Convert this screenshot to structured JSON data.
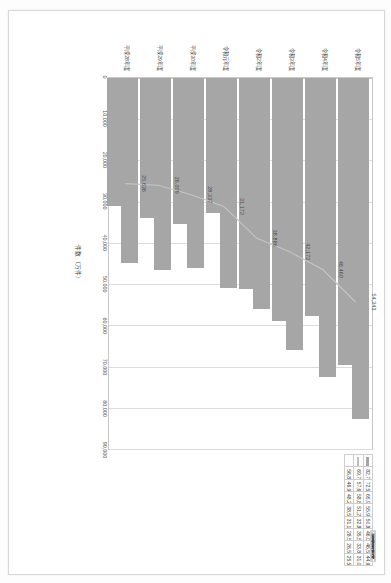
{
  "chart_data": {
    "type": "bar",
    "title": "",
    "xlabel": "件数（万件）",
    "ylabel": "",
    "ylim": [
      0,
      90000
    ],
    "grid": true,
    "legend_position": "bottom-right-table",
    "axis_title_lines": [
      "件数",
      "（万件）"
    ],
    "categories": [
      "令和5年度",
      "令和4年度",
      "令和3年度",
      "令和2年度",
      "令和元年度",
      "平成30年度",
      "平成29年度",
      "平成28年度"
    ],
    "tick_labels": [
      "0",
      "10,000",
      "20,000",
      "30,000",
      "40,000",
      "50,000",
      "60,000",
      "70,000",
      "80,000",
      "90,000"
    ],
    "tick_values": [
      0,
      10000,
      20000,
      30000,
      40000,
      50000,
      60000,
      70000,
      80000,
      90000
    ],
    "series": [
      {
        "name": "件数",
        "kind": "bar",
        "color": "#a6a6a6",
        "values": [
          82711,
          72500,
          65935,
          55986,
          50876,
          46089,
          46545,
          44932
        ]
      },
      {
        "name": "うち処理済",
        "kind": "bar",
        "color": "#a6a6a6",
        "values": [
          69724,
          57640,
          58884,
          51202,
          32870,
          35502,
          33869,
          31074
        ]
      },
      {
        "name": "うち未処理",
        "kind": "line",
        "color": "#bfbfbf",
        "values": [
          54343,
          46460,
          42172,
          38886,
          31172,
          28337,
          26009,
          25636
        ],
        "data_labels": [
          "54,343",
          "46,460",
          "42,172",
          "38,886",
          "31,172",
          "28,337",
          "26,009",
          "25,636"
        ]
      },
      {
        "name": "割合",
        "kind": "table-only",
        "values": [
          56845,
          46940,
          48243,
          38535,
          31113,
          28507,
          26535,
          25568
        ]
      }
    ],
    "table": {
      "row_labels": [
        "件数",
        "うち処理済",
        "うち未処理"
      ],
      "rows": [
        {
          "label": "件数",
          "swatch": "bar-s",
          "values": [
            82711,
            72500,
            65935,
            55986,
            50876,
            46089,
            46545,
            44932
          ]
        },
        {
          "label": "うち処理済",
          "swatch": "line-s",
          "values": [
            69724,
            57640,
            58884,
            51202,
            32870,
            35502,
            33869,
            31074
          ]
        },
        {
          "label": "うち未処理",
          "swatch": "none-s",
          "values": [
            56845,
            46940,
            48243,
            38535,
            31113,
            28507,
            26535,
            25568
          ]
        }
      ]
    }
  }
}
